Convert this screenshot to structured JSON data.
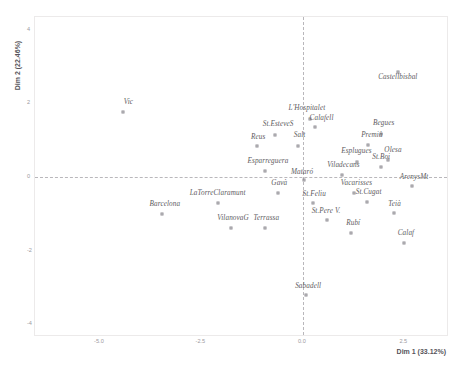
{
  "chart_data": {
    "type": "scatter",
    "title": "",
    "subtitle": "",
    "xlabel": "Dim 1 (33.12%)",
    "ylabel": "Dim 2 (22.46%)",
    "xlim": [
      -6.6,
      3.6
    ],
    "ylim": [
      -4.35,
      4.35
    ],
    "xticks": [
      "-5.0",
      "-2.5",
      "0.0",
      "2.5"
    ],
    "xtick_values": [
      -5.0,
      -2.5,
      0.0,
      2.5
    ],
    "yticks": [
      "4",
      "2",
      "0",
      "-2",
      "-4"
    ],
    "ytick_values": [
      4,
      2,
      0,
      -2,
      -4
    ],
    "grid": false,
    "legend": null,
    "reference_lines": {
      "horizontal": 0,
      "vertical": 0,
      "style": "dashed",
      "color": "#b9b7bb"
    },
    "marker": {
      "shape": "open-square",
      "edge_color": "#8f8d93",
      "fill": "none",
      "size_px": 3
    },
    "label_style": {
      "font": "serif-italic",
      "color": "#5d5b60"
    },
    "points": [
      {
        "label": "Castellbisbal",
        "x": 2.34,
        "y": 2.86,
        "lx": 2.34,
        "ly": 2.62
      },
      {
        "label": "Vic",
        "x": -4.42,
        "y": 1.78,
        "lx": -4.3,
        "ly": 1.94
      },
      {
        "label": "L'Hospitalet",
        "x": 0.18,
        "y": 1.58,
        "lx": 0.1,
        "ly": 1.76
      },
      {
        "label": "Calafell",
        "x": 0.3,
        "y": 1.36,
        "lx": 0.46,
        "ly": 1.5
      },
      {
        "label": "Begues",
        "x": 1.93,
        "y": 1.16,
        "lx": 1.99,
        "ly": 1.35
      },
      {
        "label": "St.EsteveS",
        "x": -0.69,
        "y": 1.14,
        "lx": -0.61,
        "ly": 1.32
      },
      {
        "label": "Premià",
        "x": 1.6,
        "y": 0.86,
        "lx": 1.7,
        "ly": 1.04
      },
      {
        "label": "Salt",
        "x": -0.13,
        "y": 0.83,
        "lx": -0.08,
        "ly": 1.02
      },
      {
        "label": "Reus",
        "x": -1.12,
        "y": 0.83,
        "lx": -1.1,
        "ly": 0.98
      },
      {
        "label": "Esplugues",
        "x": 1.33,
        "y": 0.41,
        "lx": 1.32,
        "ly": 0.59
      },
      {
        "label": "Olesa",
        "x": 2.09,
        "y": 0.47,
        "lx": 2.22,
        "ly": 0.63
      },
      {
        "label": "St.Boi",
        "x": 1.92,
        "y": 0.26,
        "lx": 1.93,
        "ly": 0.43
      },
      {
        "label": "Esparreguera",
        "x": -0.93,
        "y": 0.16,
        "lx": -0.86,
        "ly": 0.33
      },
      {
        "label": "Viladecans",
        "x": 0.97,
        "y": 0.05,
        "lx": 1.0,
        "ly": 0.22
      },
      {
        "label": "Mataró",
        "x": 0.03,
        "y": -0.07,
        "lx": -0.02,
        "ly": 0.04
      },
      {
        "label": "ArenysMt",
        "x": 2.7,
        "y": -0.24,
        "lx": 2.74,
        "ly": -0.1
      },
      {
        "label": "Gavà",
        "x": -0.62,
        "y": -0.43,
        "lx": -0.58,
        "ly": -0.27
      },
      {
        "label": "Vacarisses",
        "x": 1.25,
        "y": -0.44,
        "lx": 1.32,
        "ly": -0.28
      },
      {
        "label": "LaTorreClaramunt",
        "x": -2.1,
        "y": -0.7,
        "lx": -2.1,
        "ly": -0.54
      },
      {
        "label": "St.Feliu",
        "x": 0.24,
        "y": -0.72,
        "lx": 0.28,
        "ly": -0.58
      },
      {
        "label": "St.Cugat",
        "x": 1.57,
        "y": -0.68,
        "lx": 1.62,
        "ly": -0.53
      },
      {
        "label": "Barcelona",
        "x": -3.46,
        "y": -1.0,
        "lx": -3.4,
        "ly": -0.85
      },
      {
        "label": "Teià",
        "x": 2.24,
        "y": -0.99,
        "lx": 2.26,
        "ly": -0.83
      },
      {
        "label": "St.Pere V.",
        "x": 0.6,
        "y": -1.18,
        "lx": 0.57,
        "ly": -1.02
      },
      {
        "label": "VilanovaG",
        "x": -1.76,
        "y": -1.38,
        "lx": -1.72,
        "ly": -1.22
      },
      {
        "label": "Terrassa",
        "x": -0.94,
        "y": -1.38,
        "lx": -0.9,
        "ly": -1.22
      },
      {
        "label": "Rubí",
        "x": 1.18,
        "y": -1.52,
        "lx": 1.24,
        "ly": -1.36
      },
      {
        "label": "Calaf",
        "x": 2.49,
        "y": -1.79,
        "lx": 2.54,
        "ly": -1.64
      },
      {
        "label": "Sabadell",
        "x": 0.08,
        "y": -3.22,
        "lx": 0.13,
        "ly": -3.06
      }
    ]
  }
}
